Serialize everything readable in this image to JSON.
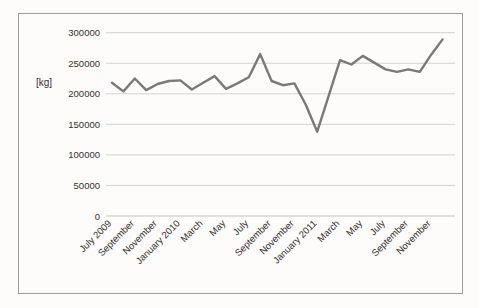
{
  "chart_data": {
    "type": "line",
    "title": "",
    "xlabel": "",
    "ylabel": "[kg]",
    "legend": "none",
    "grid": true,
    "ylim": [
      0,
      300000
    ],
    "ytick_step": 50000,
    "ytick_labels": [
      "0",
      "50000",
      "100000",
      "150000",
      "200000",
      "250000",
      "300000"
    ],
    "categories": [
      "July 2009",
      "August 2009",
      "September 2009",
      "October 2009",
      "November 2009",
      "December 2009",
      "January 2010",
      "February 2010",
      "March 2010",
      "April 2010",
      "May 2010",
      "June 2010",
      "July 2010",
      "August 2010",
      "September 2010",
      "October 2010",
      "November 2010",
      "December 2010",
      "January 2011",
      "February 2011",
      "March 2011",
      "April 2011",
      "May 2011",
      "June 2011",
      "July 2011",
      "August 2011",
      "September 2011",
      "October 2011",
      "November 2011",
      "December 2011"
    ],
    "values": [
      218000,
      204000,
      225000,
      206000,
      216000,
      221000,
      222000,
      207000,
      218000,
      229000,
      208000,
      217000,
      227000,
      265000,
      221000,
      214000,
      217000,
      182000,
      138000,
      196000,
      255000,
      248000,
      262000,
      251000,
      240000,
      236000,
      240000,
      236000,
      264000,
      289000
    ],
    "xtick_labels": [
      "July 2009",
      "September",
      "November",
      "January 2010",
      "March",
      "May",
      "July",
      "September",
      "November",
      "January 2011",
      "March",
      "May",
      "July",
      "September",
      "November"
    ],
    "xtick_point_indices": [
      0,
      2,
      4,
      6,
      8,
      10,
      12,
      14,
      16,
      18,
      20,
      22,
      24,
      26,
      28
    ],
    "colors": {
      "line": "#7b7975",
      "gridline": "#d4d2cd",
      "axis_line": "#c4c2bd",
      "frame_border": "#9d9b97",
      "text": "#33312e",
      "background": "#fdfcfa"
    }
  }
}
